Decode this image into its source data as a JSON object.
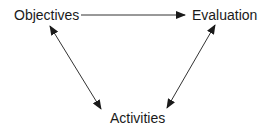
{
  "diagram": {
    "nodes": [
      {
        "id": "objectives",
        "label": "Objectives"
      },
      {
        "id": "evaluation",
        "label": "Evaluation"
      },
      {
        "id": "activities",
        "label": "Activities"
      }
    ],
    "edges": [
      {
        "from": "objectives",
        "to": "evaluation",
        "direction": "one-way"
      },
      {
        "from": "objectives",
        "to": "activities",
        "direction": "two-way"
      },
      {
        "from": "evaluation",
        "to": "activities",
        "direction": "two-way"
      }
    ],
    "colors": {
      "line": "#333333",
      "text": "#1a1a1a",
      "background": "#ffffff"
    }
  }
}
